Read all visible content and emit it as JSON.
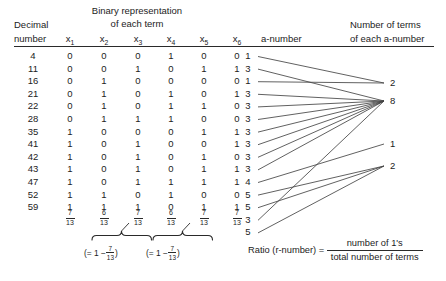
{
  "headers": {
    "decimal_line1": "Decimal",
    "decimal_line2": "number",
    "binary_line1": "Binary representation",
    "binary_line2": "of each term",
    "variables": [
      "x",
      "x",
      "x",
      "x",
      "x",
      "x"
    ],
    "variable_subscripts": [
      "1",
      "2",
      "3",
      "4",
      "5",
      "6"
    ],
    "a_number": "a-number",
    "terms_line1": "Number of terms",
    "terms_line2": "of each a-number"
  },
  "rows": [
    {
      "decimal": "4",
      "bits": [
        "0",
        "0",
        "0",
        "1",
        "0",
        "0"
      ],
      "a_number": "1"
    },
    {
      "decimal": "11",
      "bits": [
        "0",
        "0",
        "1",
        "0",
        "1",
        "1"
      ],
      "a_number": "3"
    },
    {
      "decimal": "16",
      "bits": [
        "0",
        "1",
        "0",
        "0",
        "0",
        "0"
      ],
      "a_number": "1"
    },
    {
      "decimal": "21",
      "bits": [
        "0",
        "1",
        "0",
        "1",
        "0",
        "1"
      ],
      "a_number": "3"
    },
    {
      "decimal": "22",
      "bits": [
        "0",
        "1",
        "0",
        "1",
        "1",
        "0"
      ],
      "a_number": "3"
    },
    {
      "decimal": "28",
      "bits": [
        "0",
        "1",
        "1",
        "1",
        "0",
        "0"
      ],
      "a_number": "3"
    },
    {
      "decimal": "35",
      "bits": [
        "1",
        "0",
        "0",
        "0",
        "1",
        "1"
      ],
      "a_number": "3"
    },
    {
      "decimal": "41",
      "bits": [
        "1",
        "0",
        "1",
        "0",
        "0",
        "1"
      ],
      "a_number": "3"
    },
    {
      "decimal": "42",
      "bits": [
        "1",
        "0",
        "1",
        "0",
        "1",
        "0"
      ],
      "a_number": "3"
    },
    {
      "decimal": "43",
      "bits": [
        "1",
        "0",
        "1",
        "0",
        "1",
        "1"
      ],
      "a_number": "3"
    },
    {
      "decimal": "47",
      "bits": [
        "1",
        "0",
        "1",
        "1",
        "1",
        "1"
      ],
      "a_number": "4"
    },
    {
      "decimal": "52",
      "bits": [
        "1",
        "1",
        "0",
        "1",
        "0",
        "0"
      ],
      "a_number": "5"
    },
    {
      "decimal": "59",
      "bits": [
        "1",
        "1",
        "1",
        "0",
        "1",
        "1"
      ],
      "a_number": "5"
    }
  ],
  "extra_a_numbers": [
    "3",
    "5"
  ],
  "column_fractions": [
    {
      "numerator": "7",
      "denominator": "13"
    },
    {
      "numerator": "6",
      "denominator": "13"
    },
    {
      "numerator": "7",
      "denominator": "13"
    },
    {
      "numerator": "6",
      "denominator": "13"
    },
    {
      "numerator": "7",
      "denominator": "13"
    },
    {
      "numerator": "7",
      "denominator": "13"
    }
  ],
  "brace_notes": [
    {
      "prefix": "(= 1 −",
      "numerator": "7",
      "denominator": "13",
      "suffix": ")"
    },
    {
      "prefix": "(= 1 −",
      "numerator": "7",
      "denominator": "13",
      "suffix": ")"
    }
  ],
  "term_counts": [
    {
      "value": "2"
    },
    {
      "value": "8"
    },
    {
      "value": "1"
    },
    {
      "value": "2"
    }
  ],
  "ratio": {
    "label": "Ratio (r-number) =",
    "numerator": "number of 1's",
    "denominator": "total number of terms"
  },
  "colors": {
    "ink": "#1c1c1c",
    "rule": "#2a2a2a",
    "line": "#444444",
    "background": "#ffffff"
  }
}
